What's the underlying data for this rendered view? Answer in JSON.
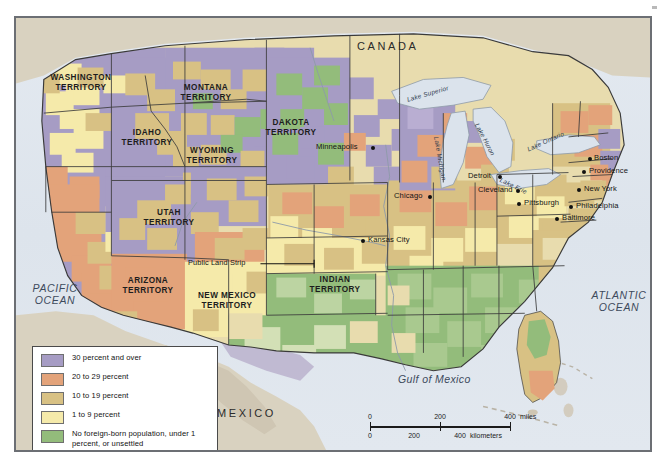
{
  "map": {
    "countries": [
      {
        "name": "CANADA",
        "x": 355,
        "y": 22
      },
      {
        "name": "MEXICO",
        "x": 215,
        "y": 389
      }
    ],
    "oceans": [
      {
        "name": "PACIFIC\nOCEAN",
        "x": 12,
        "y": 265
      },
      {
        "name": "ATLANTIC\nOCEAN",
        "x": 580,
        "y": 272
      }
    ],
    "gulf": {
      "name": "Gulf of Mexico",
      "x": 395,
      "y": 357
    },
    "territories": [
      {
        "name": "WASHINGTON\nTERRITORY",
        "x": 43,
        "y": 55
      },
      {
        "name": "MONTANA\nTERRITORY",
        "x": 178,
        "y": 66
      },
      {
        "name": "IDAHO\nTERRITORY",
        "x": 123,
        "y": 112
      },
      {
        "name": "DAKOTA\nTERRITORY",
        "x": 264,
        "y": 104
      },
      {
        "name": "WYOMING\nTERRITORY",
        "x": 185,
        "y": 131
      },
      {
        "name": "UTAH\nTERRITORY",
        "x": 146,
        "y": 194
      },
      {
        "name": "ARIZONA\nTERRITORY",
        "x": 123,
        "y": 262
      },
      {
        "name": "NEW MEXICO\nTERRITORY",
        "x": 196,
        "y": 277
      },
      {
        "name": "INDIAN\nTERRITORY",
        "x": 310,
        "y": 261
      }
    ],
    "annotations": [
      {
        "name": "Public Land Strip",
        "x": 189,
        "y": 245
      }
    ],
    "lakes": [
      {
        "name": "Lake Superior",
        "x": 404,
        "y": 84,
        "rotate": -16
      },
      {
        "name": "Lake Michigan",
        "x": 430,
        "y": 124,
        "rotate": 80
      },
      {
        "name": "Lake Huron",
        "x": 467,
        "y": 111,
        "rotate": 62
      },
      {
        "name": "Lake Erie",
        "x": 490,
        "y": 160,
        "rotate": 28
      },
      {
        "name": "Lake Ontario",
        "x": 519,
        "y": 128,
        "rotate": -26
      }
    ],
    "cities": [
      {
        "name": "Minneapolis",
        "label_x": 305,
        "label_y": 127,
        "dot_x": 356,
        "dot_y": 130
      },
      {
        "name": "Chicago",
        "label_x": 379,
        "label_y": 176,
        "dot_x": 432,
        "dot_y": 179
      },
      {
        "name": "Detroit",
        "label_x": 452,
        "label_y": 156,
        "dot_x": 491,
        "dot_y": 159
      },
      {
        "name": "Cleveland",
        "label_x": 468,
        "label_y": 168,
        "dot_x": 512,
        "dot_y": 171
      },
      {
        "name": "Pittsburgh",
        "label_x": 516,
        "label_y": 183,
        "dot_x": 512,
        "dot_y": 186
      },
      {
        "name": "Kansas City",
        "label_x": 365,
        "label_y": 219,
        "dot_x": 358,
        "dot_y": 222
      },
      {
        "name": "Boston",
        "label_x": 593,
        "label_y": 139,
        "dot_x": 588,
        "dot_y": 142
      },
      {
        "name": "Providence",
        "label_x": 588,
        "label_y": 151,
        "dot_x": 594,
        "dot_y": 148
      },
      {
        "name": "New York",
        "label_x": 584,
        "label_y": 170,
        "dot_x": 580,
        "dot_y": 168
      },
      {
        "name": "Philadelphia",
        "label_x": 574,
        "label_y": 187,
        "dot_x": 570,
        "dot_y": 187
      },
      {
        "name": "Baltimore",
        "label_x": 556,
        "label_y": 199,
        "dot_x": 552,
        "dot_y": 199
      }
    ]
  },
  "legend": {
    "items": [
      {
        "label": "30 percent and over",
        "color": "#a69cc4"
      },
      {
        "label": "20 to 29 percent",
        "color": "#e3a37a"
      },
      {
        "label": "10 to 19 percent",
        "color": "#d8c184"
      },
      {
        "label": "1 to 9 percent",
        "color": "#f5eaaa"
      },
      {
        "label": "No foreign-born population,\nunder 1 percent, or unsettled",
        "color": "#93bc7b"
      }
    ]
  },
  "scalebar": {
    "miles": {
      "ticks": [
        "0",
        "200",
        "400"
      ],
      "unit": "miles"
    },
    "kilometers": {
      "ticks": [
        "0",
        "200",
        "400"
      ],
      "unit": "kilometers"
    }
  },
  "colors": {
    "water": "#dde4ec",
    "neutral_land": "#d9d2c0",
    "border": "#6c6f74",
    "state_line": "#3a3a3a",
    "purple": "#a69cc4",
    "salmon": "#e3a37a",
    "tan": "#d8c184",
    "pale": "#f5eaaa",
    "green": "#93bc7b"
  }
}
